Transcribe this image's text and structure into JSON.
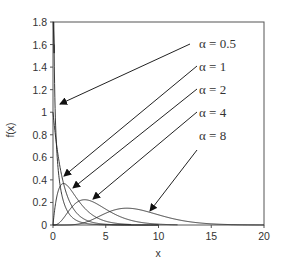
{
  "chart_data": {
    "type": "line",
    "title": "",
    "xlabel": "x",
    "ylabel": "f(x)",
    "xlim": [
      0,
      20
    ],
    "ylim": [
      0,
      1.8
    ],
    "x_ticks": [
      "0",
      "5",
      "10",
      "15",
      "20"
    ],
    "y_ticks": [
      "0",
      "0.2",
      "0.4",
      "0.6",
      "0.8",
      "1",
      "1.2",
      "1.4",
      "1.6",
      "1.8"
    ],
    "grid": false,
    "legend_position": "annotations with arrows, upper right",
    "series": [
      {
        "name": "α = 0.5",
        "shape": 0.5,
        "peak_x": 0,
        "peak_y": 1.6,
        "note": "diverges at x→0, clipped near 1.6"
      },
      {
        "name": "α = 1",
        "shape": 1,
        "peak_x": 0,
        "peak_y": 1.0
      },
      {
        "name": "α = 2",
        "shape": 2,
        "peak_x": 1,
        "peak_y": 0.37
      },
      {
        "name": "α = 4",
        "shape": 4,
        "peak_x": 3,
        "peak_y": 0.22
      },
      {
        "name": "α = 8",
        "shape": 8,
        "peak_x": 7,
        "peak_y": 0.15
      }
    ],
    "annotations": [
      {
        "label": "α = 0.5",
        "label_pos": [
          199,
          48
        ],
        "arrow_from": [
          190,
          44
        ],
        "arrow_to": [
          60,
          104
        ]
      },
      {
        "label": "α = 1",
        "label_pos": [
          199,
          71
        ],
        "arrow_from": [
          197,
          66
        ],
        "arrow_to": [
          64,
          176
        ]
      },
      {
        "label": "α = 2",
        "label_pos": [
          199,
          94
        ],
        "arrow_from": [
          197,
          89
        ],
        "arrow_to": [
          73,
          188
        ]
      },
      {
        "label": "α = 4",
        "label_pos": [
          199,
          117
        ],
        "arrow_from": [
          197,
          112
        ],
        "arrow_to": [
          93,
          199
        ]
      },
      {
        "label": "α = 8",
        "label_pos": [
          199,
          140
        ],
        "arrow_from": [
          197,
          150
        ],
        "arrow_to": [
          150,
          211
        ]
      }
    ]
  }
}
